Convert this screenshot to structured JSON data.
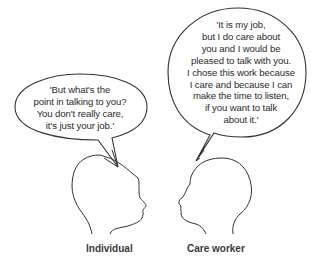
{
  "figure": {
    "stroke_color": "#333333",
    "background": "#ffffff"
  },
  "individual": {
    "label": "Individual",
    "speech_lines": [
      "'But what's the",
      "point in talking to you?",
      "You don't really care,",
      "it's just your job.'"
    ]
  },
  "care_worker": {
    "label": "Care worker",
    "speech_lines": [
      "'It is my job,",
      "but I do care about",
      "you and I would be",
      "pleased to talk with you.",
      "I chose this work because",
      "I care and because I can",
      "make the time to listen,",
      "if you want to talk",
      "about it.'"
    ]
  }
}
